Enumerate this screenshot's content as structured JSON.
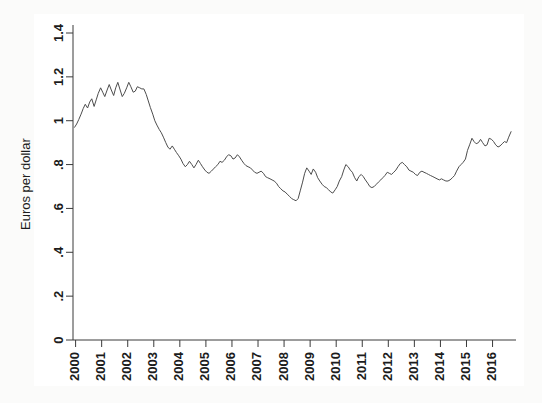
{
  "header": {
    "faint_text": ""
  },
  "chart_data": {
    "type": "line",
    "title": "",
    "xlabel": "",
    "ylabel": "Euros per dollar",
    "ylim": [
      0,
      1.4
    ],
    "xlim": [
      1999.9,
      2016.9
    ],
    "grid": false,
    "legend": null,
    "line_color": "#4d4d4d",
    "background_color": "#ffffff",
    "page_background_color": "#fbfbfa",
    "ytick_labels": [
      "0",
      ".2",
      ".4",
      ".6",
      ".8",
      "1",
      "1.2",
      "1.4"
    ],
    "ytick_values": [
      0,
      0.2,
      0.4,
      0.6,
      0.8,
      1.0,
      1.2,
      1.4
    ],
    "xtick_labels": [
      "2000",
      "2001",
      "2002",
      "2003",
      "2004",
      "2005",
      "2006",
      "2007",
      "2008",
      "2009",
      "2010",
      "2011",
      "2012",
      "2013",
      "2014",
      "2015",
      "2016"
    ],
    "xtick_values": [
      2000,
      2001,
      2002,
      2003,
      2004,
      2005,
      2006,
      2007,
      2008,
      2009,
      2010,
      2011,
      2012,
      2013,
      2014,
      2015,
      2016
    ],
    "series": [
      {
        "name": "Euros per dollar",
        "x": [
          1999.96,
          2000.04,
          2000.12,
          2000.21,
          2000.29,
          2000.37,
          2000.46,
          2000.54,
          2000.62,
          2000.71,
          2000.79,
          2000.87,
          2000.96,
          2001.04,
          2001.12,
          2001.21,
          2001.29,
          2001.37,
          2001.46,
          2001.54,
          2001.62,
          2001.71,
          2001.79,
          2001.87,
          2001.96,
          2002.04,
          2002.12,
          2002.21,
          2002.29,
          2002.37,
          2002.46,
          2002.54,
          2002.62,
          2002.71,
          2002.79,
          2002.87,
          2002.96,
          2003.04,
          2003.12,
          2003.21,
          2003.29,
          2003.37,
          2003.46,
          2003.54,
          2003.62,
          2003.71,
          2003.79,
          2003.87,
          2003.96,
          2004.04,
          2004.12,
          2004.21,
          2004.29,
          2004.37,
          2004.46,
          2004.54,
          2004.62,
          2004.71,
          2004.79,
          2004.87,
          2004.96,
          2005.04,
          2005.12,
          2005.21,
          2005.29,
          2005.37,
          2005.46,
          2005.54,
          2005.62,
          2005.71,
          2005.79,
          2005.87,
          2005.96,
          2006.04,
          2006.12,
          2006.21,
          2006.29,
          2006.37,
          2006.46,
          2006.54,
          2006.62,
          2006.71,
          2006.79,
          2006.87,
          2006.96,
          2007.04,
          2007.12,
          2007.21,
          2007.29,
          2007.37,
          2007.46,
          2007.54,
          2007.62,
          2007.71,
          2007.79,
          2007.87,
          2007.96,
          2008.04,
          2008.12,
          2008.21,
          2008.29,
          2008.37,
          2008.46,
          2008.54,
          2008.62,
          2008.71,
          2008.79,
          2008.87,
          2008.96,
          2009.04,
          2009.12,
          2009.21,
          2009.29,
          2009.37,
          2009.46,
          2009.54,
          2009.62,
          2009.71,
          2009.79,
          2009.87,
          2009.96,
          2010.04,
          2010.12,
          2010.21,
          2010.29,
          2010.37,
          2010.46,
          2010.54,
          2010.62,
          2010.71,
          2010.79,
          2010.87,
          2010.96,
          2011.04,
          2011.12,
          2011.21,
          2011.29,
          2011.37,
          2011.46,
          2011.54,
          2011.62,
          2011.71,
          2011.79,
          2011.87,
          2011.96,
          2012.04,
          2012.12,
          2012.21,
          2012.29,
          2012.37,
          2012.46,
          2012.54,
          2012.62,
          2012.71,
          2012.79,
          2012.87,
          2012.96,
          2013.04,
          2013.12,
          2013.21,
          2013.29,
          2013.37,
          2013.46,
          2013.54,
          2013.62,
          2013.71,
          2013.79,
          2013.87,
          2013.96,
          2014.04,
          2014.12,
          2014.21,
          2014.29,
          2014.37,
          2014.46,
          2014.54,
          2014.62,
          2014.71,
          2014.79,
          2014.87,
          2014.96,
          2015.04,
          2015.12,
          2015.21,
          2015.29,
          2015.37,
          2015.46,
          2015.54,
          2015.62,
          2015.71,
          2015.79,
          2015.87,
          2015.96,
          2016.04,
          2016.12,
          2016.21,
          2016.29,
          2016.37,
          2016.46,
          2016.54,
          2016.62,
          2016.71
        ],
        "y": [
          0.97,
          0.985,
          1.005,
          1.03,
          1.055,
          1.075,
          1.058,
          1.085,
          1.1,
          1.065,
          1.095,
          1.125,
          1.15,
          1.13,
          1.11,
          1.14,
          1.165,
          1.14,
          1.115,
          1.15,
          1.175,
          1.14,
          1.11,
          1.125,
          1.15,
          1.175,
          1.155,
          1.13,
          1.135,
          1.155,
          1.15,
          1.145,
          1.145,
          1.12,
          1.09,
          1.06,
          1.03,
          1.0,
          0.98,
          0.96,
          0.945,
          0.925,
          0.9,
          0.88,
          0.87,
          0.885,
          0.87,
          0.855,
          0.84,
          0.825,
          0.805,
          0.79,
          0.8,
          0.815,
          0.8,
          0.785,
          0.8,
          0.82,
          0.805,
          0.79,
          0.775,
          0.765,
          0.76,
          0.77,
          0.78,
          0.79,
          0.8,
          0.815,
          0.81,
          0.82,
          0.835,
          0.845,
          0.84,
          0.825,
          0.83,
          0.845,
          0.835,
          0.82,
          0.805,
          0.795,
          0.79,
          0.785,
          0.775,
          0.765,
          0.76,
          0.765,
          0.77,
          0.76,
          0.745,
          0.74,
          0.735,
          0.73,
          0.725,
          0.715,
          0.7,
          0.69,
          0.68,
          0.675,
          0.665,
          0.655,
          0.645,
          0.64,
          0.635,
          0.645,
          0.68,
          0.72,
          0.76,
          0.785,
          0.77,
          0.755,
          0.78,
          0.765,
          0.74,
          0.725,
          0.71,
          0.7,
          0.695,
          0.685,
          0.675,
          0.67,
          0.685,
          0.7,
          0.725,
          0.745,
          0.775,
          0.8,
          0.79,
          0.775,
          0.765,
          0.74,
          0.725,
          0.745,
          0.755,
          0.745,
          0.73,
          0.715,
          0.7,
          0.695,
          0.7,
          0.71,
          0.72,
          0.73,
          0.74,
          0.75,
          0.765,
          0.76,
          0.755,
          0.765,
          0.775,
          0.79,
          0.805,
          0.81,
          0.8,
          0.79,
          0.775,
          0.77,
          0.765,
          0.755,
          0.75,
          0.765,
          0.77,
          0.765,
          0.76,
          0.755,
          0.75,
          0.745,
          0.74,
          0.735,
          0.73,
          0.735,
          0.73,
          0.725,
          0.725,
          0.73,
          0.74,
          0.75,
          0.77,
          0.79,
          0.8,
          0.81,
          0.825,
          0.865,
          0.89,
          0.92,
          0.905,
          0.895,
          0.9,
          0.915,
          0.9,
          0.885,
          0.89,
          0.92,
          0.915,
          0.905,
          0.89,
          0.88,
          0.885,
          0.895,
          0.905,
          0.9,
          0.925,
          0.95
        ]
      }
    ]
  }
}
